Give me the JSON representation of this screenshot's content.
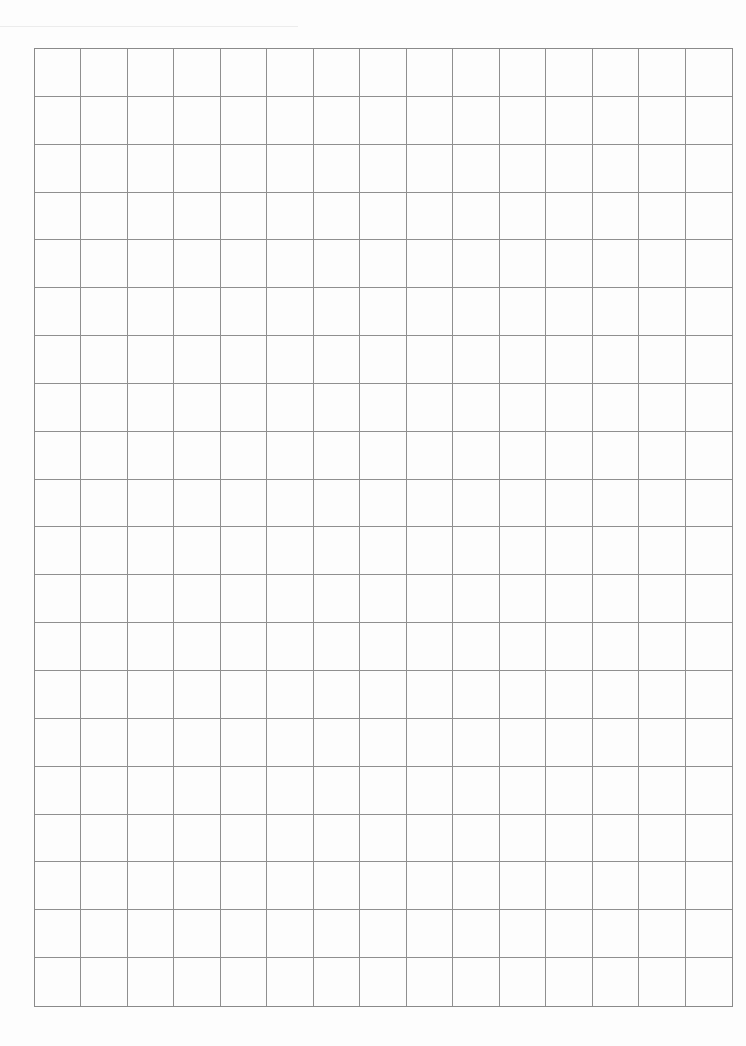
{
  "page": {
    "type": "graph-paper",
    "background_color": "#fdfdfd",
    "line_color": "#8f8f8f"
  },
  "grid": {
    "columns": 15,
    "rows": 20,
    "left": 34,
    "top": 48,
    "width": 699,
    "height": 959
  }
}
